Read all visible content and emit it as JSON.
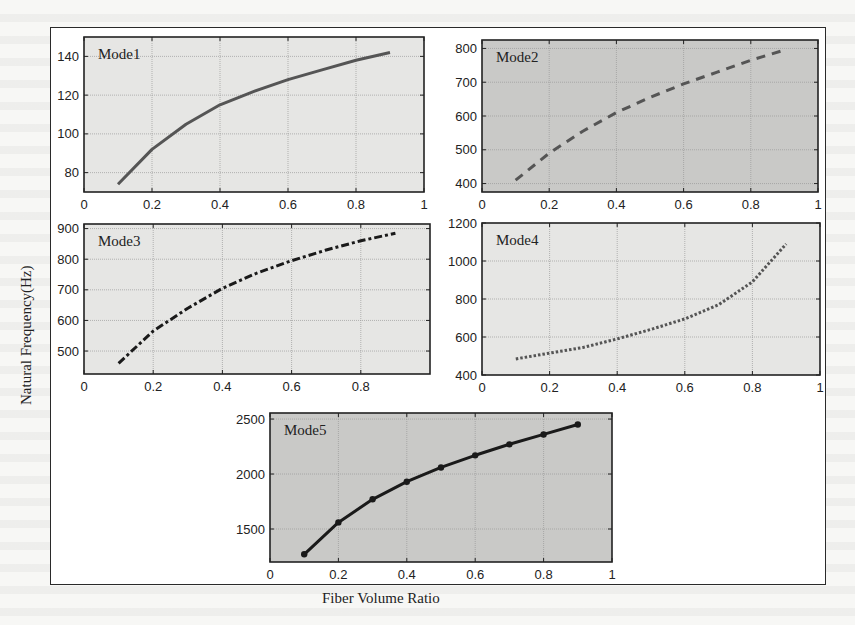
{
  "figure": {
    "ylabel": "Natural Frequency(Hz)",
    "xlabel": "Fiber Volume Ratio"
  },
  "colors": {
    "panel_light": "#e6e6e4",
    "panel_dark": "#c9c9c7",
    "grid": "#9a9a9a",
    "line_mode1": "#555555",
    "line_mode2": "#555555",
    "line_mode3": "#1a1a1a",
    "line_mode4": "#555555",
    "line_mode5": "#1a1a1a"
  },
  "chart_data": [
    {
      "type": "line",
      "title": "Mode1",
      "xlabel": "Fiber Volume Ratio",
      "ylabel": "Natural Frequency(Hz)",
      "x": [
        0.1,
        0.2,
        0.3,
        0.4,
        0.5,
        0.6,
        0.7,
        0.8,
        0.9
      ],
      "series": [
        {
          "name": "Mode1",
          "values": [
            74,
            92,
            105,
            115,
            122,
            128,
            133,
            138,
            142
          ],
          "style": "solid"
        }
      ],
      "xticks": [
        "0",
        "0.2",
        "0.4",
        "0.6",
        "0.8",
        "1"
      ],
      "yticks": [
        "80",
        "100",
        "120",
        "140"
      ],
      "xlim": [
        0,
        1
      ],
      "ylim": [
        70,
        150
      ],
      "grid": true
    },
    {
      "type": "line",
      "title": "Mode2",
      "xlabel": "Fiber Volume Ratio",
      "ylabel": "Natural Frequency(Hz)",
      "x": [
        0.1,
        0.2,
        0.3,
        0.4,
        0.5,
        0.6,
        0.7,
        0.8,
        0.9
      ],
      "series": [
        {
          "name": "Mode2",
          "values": [
            410,
            490,
            555,
            610,
            655,
            695,
            730,
            765,
            795
          ],
          "style": "dashed"
        }
      ],
      "xticks": [
        "0",
        "0.2",
        "0.4",
        "0.6",
        "0.8",
        "1"
      ],
      "yticks": [
        "400",
        "500",
        "600",
        "700",
        "800"
      ],
      "xlim": [
        0,
        1
      ],
      "ylim": [
        375,
        825
      ],
      "grid": true
    },
    {
      "type": "line",
      "title": "Mode3",
      "xlabel": "Fiber Volume Ratio",
      "ylabel": "Natural Frequency(Hz)",
      "x": [
        0.1,
        0.2,
        0.3,
        0.4,
        0.5,
        0.6,
        0.7,
        0.8,
        0.9
      ],
      "series": [
        {
          "name": "Mode3",
          "values": [
            460,
            565,
            640,
            705,
            755,
            795,
            830,
            860,
            885
          ],
          "style": "dash-dot"
        }
      ],
      "xticks": [
        "0",
        "0.2",
        "0.4",
        "0.6",
        "0.8"
      ],
      "yticks": [
        "500",
        "600",
        "700",
        "800",
        "900"
      ],
      "xlim": [
        0,
        1
      ],
      "ylim": [
        425,
        915
      ],
      "grid": true
    },
    {
      "type": "line",
      "title": "Mode4",
      "xlabel": "Fiber Volume Ratio",
      "ylabel": "Natural Frequency(Hz)",
      "x": [
        0.1,
        0.2,
        0.3,
        0.4,
        0.5,
        0.6,
        0.7,
        0.8,
        0.9
      ],
      "series": [
        {
          "name": "Mode4",
          "values": [
            485,
            515,
            545,
            590,
            640,
            695,
            770,
            890,
            1090
          ],
          "style": "dotted"
        }
      ],
      "xticks": [
        "0",
        "0.2",
        "0.4",
        "0.6",
        "0.8",
        "1"
      ],
      "yticks": [
        "400",
        "600",
        "800",
        "1000",
        "1200"
      ],
      "xlim": [
        0,
        1
      ],
      "ylim": [
        400,
        1200
      ],
      "grid": true
    },
    {
      "type": "line",
      "title": "Mode5",
      "xlabel": "Fiber Volume Ratio",
      "ylabel": "Natural Frequency(Hz)",
      "x": [
        0.1,
        0.2,
        0.3,
        0.4,
        0.5,
        0.6,
        0.7,
        0.8,
        0.9
      ],
      "series": [
        {
          "name": "Mode5",
          "values": [
            1270,
            1560,
            1770,
            1930,
            2060,
            2170,
            2270,
            2360,
            2450
          ],
          "style": "solid-markers"
        }
      ],
      "xticks": [
        "0",
        "0.2",
        "0.4",
        "0.6",
        "0.8",
        "1"
      ],
      "yticks": [
        "1500",
        "2000",
        "2500"
      ],
      "xlim": [
        0,
        1
      ],
      "ylim": [
        1200,
        2555
      ],
      "grid": true
    }
  ]
}
